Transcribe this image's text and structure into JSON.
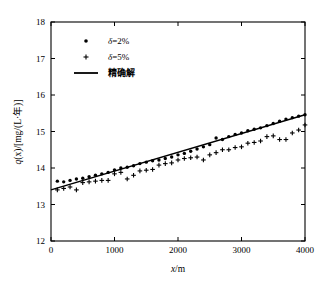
{
  "chart_data": {
    "type": "scatter",
    "title": "",
    "xlabel": "x/m",
    "ylabel": "q(x)/[mg/(L·年)]",
    "xlim": [
      0,
      4000
    ],
    "ylim": [
      12,
      18
    ],
    "xticks": [
      0,
      1000,
      2000,
      3000,
      4000
    ],
    "yticks": [
      12,
      13,
      14,
      15,
      16,
      17,
      18
    ],
    "xtick_labels": [
      "0",
      "1000",
      "2000",
      "3000",
      "4000"
    ],
    "ytick_labels": [
      "12",
      "13",
      "14",
      "15",
      "16",
      "17",
      "18"
    ],
    "grid": false,
    "legend_position": "upper-left",
    "legend": [
      {
        "label": "δ=2%",
        "marker": "dot",
        "style": "scatter"
      },
      {
        "label": "δ=5%",
        "marker": "plus",
        "style": "scatter"
      },
      {
        "label": "精确解",
        "marker": "line",
        "style": "line"
      }
    ],
    "series": [
      {
        "name": "δ=2%",
        "marker": "dot",
        "x": [
          100,
          200,
          300,
          400,
          500,
          600,
          700,
          800,
          900,
          1000,
          1100,
          1200,
          1300,
          1400,
          1500,
          1600,
          1700,
          1800,
          1900,
          2000,
          2100,
          2200,
          2300,
          2400,
          2500,
          2600,
          2700,
          2800,
          2900,
          3000,
          3100,
          3200,
          3300,
          3400,
          3500,
          3600,
          3700,
          3800,
          3900,
          4000
        ],
        "values": [
          13.64,
          13.62,
          13.66,
          13.7,
          13.72,
          13.76,
          13.8,
          13.84,
          13.88,
          13.95,
          14.0,
          14.02,
          14.06,
          14.12,
          14.16,
          14.2,
          14.22,
          14.26,
          14.3,
          14.36,
          14.4,
          14.46,
          14.52,
          14.58,
          14.64,
          14.82,
          14.78,
          14.86,
          14.92,
          14.96,
          15.02,
          15.06,
          15.1,
          15.16,
          15.22,
          15.28,
          15.34,
          15.38,
          15.42,
          15.46
        ]
      },
      {
        "name": "δ=5%",
        "marker": "plus",
        "x": [
          100,
          200,
          300,
          400,
          500,
          600,
          700,
          800,
          900,
          1000,
          1100,
          1200,
          1300,
          1400,
          1500,
          1600,
          1700,
          1800,
          1900,
          2000,
          2100,
          2200,
          2300,
          2400,
          2500,
          2600,
          2700,
          2800,
          2900,
          3000,
          3100,
          3200,
          3300,
          3400,
          3500,
          3600,
          3700,
          3800,
          3900,
          4000
        ],
        "values": [
          13.4,
          13.44,
          13.48,
          13.4,
          13.6,
          13.62,
          13.64,
          13.66,
          13.66,
          13.84,
          13.88,
          13.7,
          13.8,
          13.92,
          13.94,
          13.96,
          14.08,
          14.12,
          14.14,
          14.22,
          14.26,
          14.28,
          14.3,
          14.22,
          14.36,
          14.42,
          14.5,
          14.5,
          14.56,
          14.58,
          14.68,
          14.7,
          14.74,
          14.86,
          14.88,
          14.78,
          14.78,
          14.96,
          15.04,
          15.18
        ]
      }
    ],
    "exact_solution": {
      "name": "精确解",
      "type": "line",
      "x": [
        0,
        4000
      ],
      "values": [
        13.4,
        15.46
      ]
    }
  }
}
